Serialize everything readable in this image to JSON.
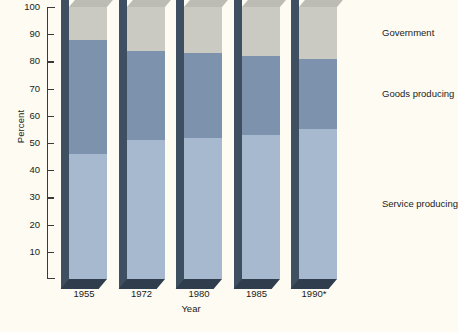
{
  "chart_data": {
    "type": "bar",
    "subtype": "stacked-percent-3d",
    "title": "",
    "xlabel": "Year",
    "ylabel": "Percent",
    "ylim": [
      0,
      100
    ],
    "yticks": [
      10,
      20,
      30,
      40,
      50,
      60,
      70,
      80,
      90,
      100
    ],
    "ytick_labels": [
      "10",
      "20",
      "30",
      "40",
      "50",
      "60",
      "70",
      "80",
      "90",
      "100"
    ],
    "grid": false,
    "legend_position": "right",
    "categories": [
      "1955",
      "1972",
      "1980",
      "1985",
      "1990*"
    ],
    "series": [
      {
        "name": "Service producing",
        "color": "#a6b9cf",
        "values": [
          46,
          51,
          52,
          53,
          55
        ]
      },
      {
        "name": "Goods producing",
        "color": "#7d92ad",
        "values": [
          42,
          33,
          31,
          29,
          26
        ]
      },
      {
        "name": "Government",
        "color": "#cbcac2",
        "values": [
          12,
          16,
          17,
          18,
          19
        ]
      }
    ],
    "cumulative_boundaries": [
      {
        "category": "1955",
        "service_top": 46,
        "goods_top": 88,
        "government_top": 100
      },
      {
        "category": "1972",
        "service_top": 51,
        "goods_top": 84,
        "government_top": 100
      },
      {
        "category": "1980",
        "service_top": 52,
        "goods_top": 83,
        "government_top": 100
      },
      {
        "category": "1985",
        "service_top": 53,
        "goods_top": 82,
        "government_top": 100
      },
      {
        "category": "1990*",
        "service_top": 55,
        "goods_top": 81,
        "government_top": 100
      }
    ],
    "annotations": [
      "* projected"
    ]
  },
  "legend": {
    "entries": [
      {
        "label": "Government"
      },
      {
        "label": "Goods producing"
      },
      {
        "label": "Service producing"
      }
    ]
  },
  "footnote": {
    "text": ""
  },
  "colors": {
    "background": "#fdfbf2",
    "axis": "#3b3b3b",
    "service_producing": "#a6b9cf",
    "goods_producing": "#7d92ad",
    "government": "#cbcac2",
    "bar_side_dark": "#3e4f62",
    "bar_top_face": "#bdbcb4"
  }
}
